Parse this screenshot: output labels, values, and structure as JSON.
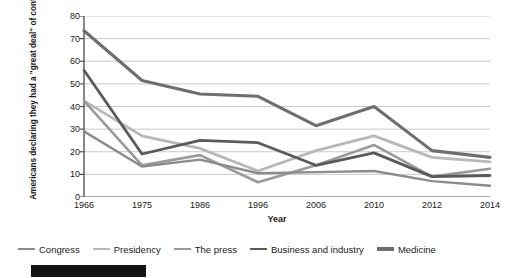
{
  "chart_data": {
    "type": "line",
    "title": "",
    "xlabel": "Year",
    "ylabel": "Americans declaring they had a \"great deal\" of confidence in the institution (percentage)",
    "categories": [
      "1966",
      "1975",
      "1986",
      "1996",
      "2006",
      "2010",
      "2012",
      "2014"
    ],
    "x": [
      1966,
      1975,
      1986,
      1996,
      2006,
      2010,
      2012,
      2014
    ],
    "ylim": [
      0,
      80
    ],
    "yticks": [
      0,
      10,
      20,
      30,
      40,
      50,
      60,
      70,
      80
    ],
    "grid": true,
    "legend_position": "bottom",
    "series": [
      {
        "name": "Congress",
        "color": "#8c8c8c",
        "width": 2.4,
        "values": [
          29,
          13.5,
          16.5,
          10.5,
          11,
          11.5,
          7,
          5
        ]
      },
      {
        "name": "Presidency",
        "color": "#b8b8b8",
        "width": 2.8,
        "values": [
          42.5,
          27,
          21.5,
          11.5,
          20.5,
          27,
          17.5,
          15.5
        ]
      },
      {
        "name": "The press",
        "color": "#9a9a9a",
        "width": 2.6,
        "values": [
          42.5,
          14,
          18.5,
          6.5,
          14,
          23,
          9,
          12.5
        ]
      },
      {
        "name": "Business and industry",
        "color": "#5a5a5a",
        "width": 2.8,
        "values": [
          56,
          19,
          25,
          24,
          14,
          19.5,
          9,
          9.5
        ]
      },
      {
        "name": "Medicine",
        "color": "#6e6e6e",
        "width": 3.1,
        "values": [
          73.5,
          51.5,
          45.5,
          44.5,
          31.5,
          40,
          20.5,
          17.5
        ]
      }
    ]
  },
  "legend": {
    "items": [
      {
        "label": "Congress"
      },
      {
        "label": "Presidency"
      },
      {
        "label": "The press"
      },
      {
        "label": "Business and industry"
      },
      {
        "label": "Medicine"
      }
    ]
  },
  "axes": {
    "x_title": "Year",
    "y_title": "Americans declaring they had a \"great deal\" of confidence in the institution (percentage)"
  },
  "colors": {
    "grid": "#c9c9c9",
    "axis": "#555555",
    "text": "#1a1a1a",
    "background": "#ffffff",
    "footer_bar": "#141414"
  }
}
